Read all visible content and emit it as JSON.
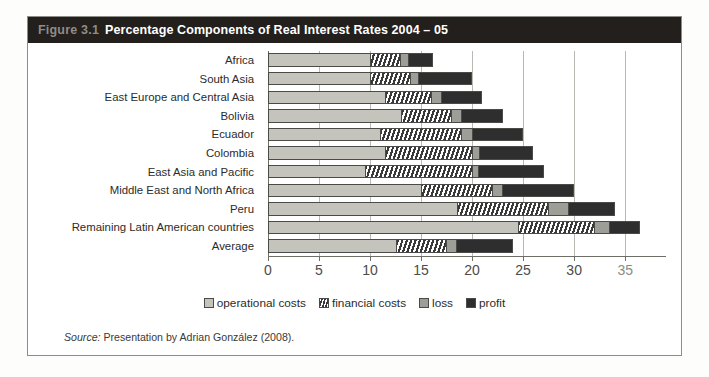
{
  "figure": {
    "number": "Figure 3.1",
    "title": "Percentage Components of Real Interest Rates 2004 – 05",
    "source_label": "Source:",
    "source_text": "Presentation by Adrian González (2008)."
  },
  "legend": {
    "items": [
      {
        "key": "operational",
        "label": "operational costs"
      },
      {
        "key": "financial",
        "label": "financial costs"
      },
      {
        "key": "loss",
        "label": "loss"
      },
      {
        "key": "profit",
        "label": "profit"
      }
    ]
  },
  "chart_data": {
    "type": "bar",
    "orientation": "horizontal",
    "stacked": true,
    "title": "Percentage Components of Real Interest Rates 2004 – 05",
    "xlabel": "",
    "ylabel": "",
    "xlim": [
      0,
      39
    ],
    "xticks": [
      0,
      5,
      10,
      15,
      20,
      25,
      30,
      35
    ],
    "xtick_labels": [
      "0",
      "5",
      "10",
      "15",
      "20",
      "25",
      "30",
      "35"
    ],
    "grid": true,
    "legend_position": "bottom-center",
    "categories": [
      "Africa",
      "South Asia",
      "East Europe and Central Asia",
      "Bolivia",
      "Ecuador",
      "Colombia",
      "East Asia and Pacific",
      "Middle East and North Africa",
      "Peru",
      "Remaining Latin American countries",
      "Average"
    ],
    "series": [
      {
        "name": "operational costs",
        "color": "#c4c4bd",
        "values": [
          10.0,
          10.0,
          11.5,
          13.0,
          11.0,
          11.5,
          9.5,
          15.0,
          18.5,
          24.5,
          12.5
        ]
      },
      {
        "name": "financial costs",
        "color": "#ffffff",
        "pattern": "diagonal-hatch",
        "values": [
          3.0,
          4.0,
          4.5,
          5.0,
          8.0,
          8.5,
          10.5,
          7.0,
          9.0,
          7.5,
          5.0
        ]
      },
      {
        "name": "loss",
        "color": "#9e9e98",
        "values": [
          0.8,
          0.7,
          1.0,
          1.0,
          1.0,
          0.7,
          0.6,
          1.0,
          2.0,
          1.5,
          1.0
        ]
      },
      {
        "name": "profit",
        "color": "#2e2e2e",
        "values": [
          2.4,
          5.3,
          4.0,
          4.0,
          5.0,
          5.3,
          6.4,
          7.0,
          4.5,
          3.0,
          5.5
        ]
      }
    ],
    "totals": [
      16.2,
      20.0,
      21.0,
      23.0,
      25.0,
      26.0,
      27.0,
      30.0,
      34.0,
      36.5,
      24.0
    ]
  }
}
